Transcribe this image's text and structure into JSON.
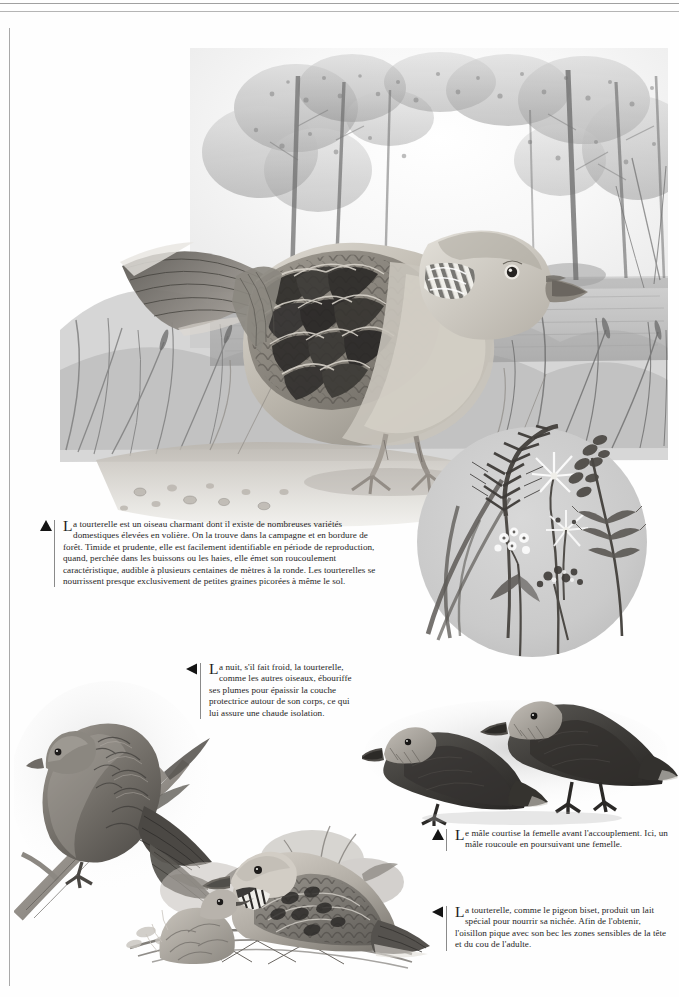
{
  "page": {
    "width": 679,
    "height": 997,
    "background": "#fefefe",
    "rule_color": "#8f8f8f",
    "subject": "tourterelle",
    "style": "grayscale-pencil-plate"
  },
  "frame": {
    "top_rule_1": "",
    "top_rule_2": "",
    "left_rule": ""
  },
  "illustrations": {
    "main_scene": {
      "name": "turtle-dove-in-woodland-clearing",
      "description": "Grande tourterelle des bois au premier plan, posée au sol, devant une clairière bordée d'arbres",
      "tone": "#8d8d8d"
    },
    "seed_circle": {
      "name": "circular-inset-grasses-and-wildflowers",
      "description": "Médaillon circulaire gris clair montrant un épi de graminée et des fleurs sauvages dont la tourterelle picore les graines",
      "tone": "#c9c9c9"
    },
    "perched_dove": {
      "name": "dove-perched-fluffed-on-branch",
      "description": "Tourterelle ébouriffée perchée sur une branche, plumes gonflées contre le froid",
      "tone": "#6e6e6e"
    },
    "nest_pair": {
      "name": "dove-feeding-chick-at-nest",
      "description": "Tourterelle adulte au nid avec son oisillon qui quémande",
      "tone": "#7a7a7a"
    },
    "courting_pair": {
      "name": "two-doves-courtship-silhouettes",
      "description": "Deux tourterelles sombres, le mâle roucoulant en poursuivant la femelle",
      "tone": "#4f4f4f"
    }
  },
  "captions": {
    "main": {
      "marker": "triangle-up",
      "dropcap": "L",
      "body": "a tourterelle est un oiseau charmant dont il existe de nombreuses variétés domestiques élevées en volière. On la trouve dans la campagne et en bordure de forêt. Timide et prudente, elle est facilement identifiable en période de reproduction, quand, perchée dans les buissons ou les haies, elle émet son roucoulement caractéristique, audible à plusieurs centaines de mètres à la ronde. Les tourterelles se nourrissent presque exclusivement de petites graines picorées à même le sol."
    },
    "night": {
      "marker": "triangle-left",
      "dropcap": "L",
      "body": "a nuit, s'il fait froid, la tourterelle, comme les autres oiseaux, ébouriffe ses plumes pour épaissir la couche protectrice autour de son corps, ce qui lui assure une chaude isolation."
    },
    "courtship": {
      "marker": "triangle-up",
      "dropcap": "L",
      "body": "e mâle courtise la femelle avant l'accouplement. Ici, un mâle roucoule en poursuivant une femelle."
    },
    "milk": {
      "marker": "triangle-left",
      "dropcap": "L",
      "body": "a tourterelle, comme le pigeon biset, produit un lait spécial pour nourrir sa nichée. Afin de l'obtenir, l'oisillon pique avec son bec les zones sensibles de la tête et du cou de l'adulte."
    }
  }
}
